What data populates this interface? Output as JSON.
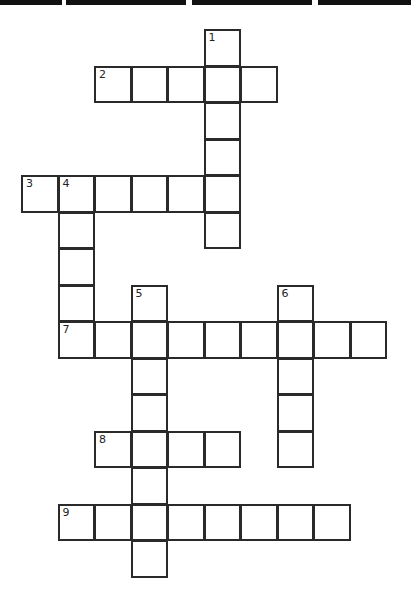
{
  "page": {
    "title_visible": false
  },
  "crossword": {
    "cell_size": 36.5,
    "origin_x": 21,
    "origin_y": 29,
    "entries": [
      {
        "number": "1",
        "direction": "down",
        "row": 0,
        "col": 5,
        "length": 6
      },
      {
        "number": "2",
        "direction": "across",
        "row": 1,
        "col": 2,
        "length": 5
      },
      {
        "number": "3",
        "direction": "across",
        "row": 4,
        "col": 0,
        "length": 6
      },
      {
        "number": "4",
        "direction": "down",
        "row": 4,
        "col": 1,
        "length": 5
      },
      {
        "number": "5",
        "direction": "down",
        "row": 7,
        "col": 3,
        "length": 8
      },
      {
        "number": "6",
        "direction": "down",
        "row": 7,
        "col": 7,
        "length": 5
      },
      {
        "number": "7",
        "direction": "across",
        "row": 8,
        "col": 1,
        "length": 9
      },
      {
        "number": "8",
        "direction": "across",
        "row": 11,
        "col": 2,
        "length": 4
      },
      {
        "number": "9",
        "direction": "across",
        "row": 13,
        "col": 1,
        "length": 8
      }
    ]
  }
}
